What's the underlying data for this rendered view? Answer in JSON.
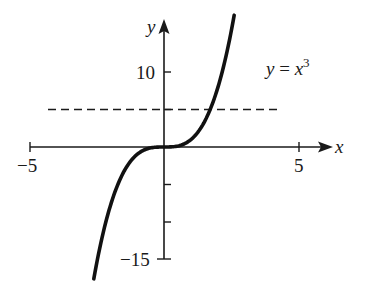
{
  "chart_data": {
    "type": "line",
    "title": "",
    "xlabel": "x",
    "ylabel": "y",
    "xlim": [
      -5,
      5
    ],
    "ylim": [
      -15,
      15
    ],
    "x_ticks": [
      -5,
      5
    ],
    "x_tick_labels": [
      "−5",
      "5"
    ],
    "y_ticks": [
      10,
      5,
      -5,
      -10,
      -15
    ],
    "y_tick_labels": [
      "10",
      "",
      "",
      "",
      "−15"
    ],
    "grid": false,
    "series": [
      {
        "name": "y = x^3",
        "style": "solid",
        "x": [
          -2.6,
          -2.0,
          -1.5,
          -1.0,
          -0.5,
          0,
          0.5,
          1.0,
          1.5,
          2.0,
          2.6
        ],
        "y": [
          -17.6,
          -8,
          -3.375,
          -1,
          -0.125,
          0,
          0.125,
          1,
          3.375,
          8,
          17.6
        ]
      },
      {
        "name": "horizontal line",
        "style": "dashed",
        "x": [
          -4.3,
          4.2
        ],
        "y": [
          5,
          5
        ]
      }
    ],
    "annotations": [
      {
        "text": "y = x³",
        "x": 4,
        "y": 10
      }
    ]
  },
  "labels": {
    "x_axis": "x",
    "y_axis": "y",
    "x_min": "−5",
    "x_max": "5",
    "y_10": "10",
    "y_neg15": "−15",
    "eq_lhs": "y",
    "eq_op": " = ",
    "eq_var": "x",
    "eq_exp": "3"
  }
}
